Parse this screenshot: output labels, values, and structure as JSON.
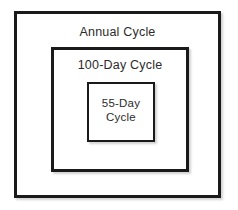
{
  "diagram": {
    "type": "nested-boxes",
    "background_color": "#ffffff",
    "border_color": "#1a1a1a",
    "text_color": "#2b2b2b",
    "levels": [
      {
        "id": "annual-cycle",
        "label": "Annual Cycle",
        "depth": 0
      },
      {
        "id": "hundred-day-cycle",
        "label": "100-Day Cycle",
        "depth": 1
      },
      {
        "id": "fifty-five-day-cycle",
        "label": "55-Day\nCycle",
        "depth": 2
      }
    ]
  }
}
